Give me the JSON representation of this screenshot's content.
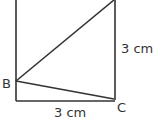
{
  "diagram": {
    "points": {
      "B": {
        "label": "B",
        "x": 16,
        "y": 81
      },
      "C": {
        "label": "C",
        "x": 114,
        "y": 99
      }
    },
    "measurements": {
      "bottom": "3 cm",
      "right": "3 cm"
    },
    "colors": {
      "stroke": "#333333",
      "background": "#ffffff"
    }
  }
}
